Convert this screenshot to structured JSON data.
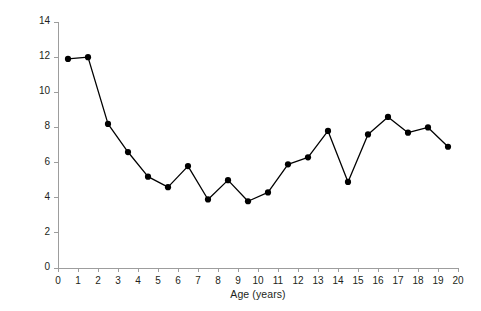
{
  "chart_data": {
    "type": "line",
    "title": "",
    "subtitle": "",
    "xlabel": "Age (years)",
    "ylabel": "AML incidence per million",
    "xlim": [
      0,
      20
    ],
    "ylim": [
      0,
      14
    ],
    "xticks": [
      0,
      1,
      2,
      3,
      4,
      5,
      6,
      7,
      8,
      9,
      10,
      11,
      12,
      13,
      14,
      15,
      16,
      17,
      18,
      19,
      20
    ],
    "yticks": [
      0,
      2,
      4,
      6,
      8,
      10,
      12,
      14
    ],
    "grid": false,
    "legend": null,
    "marker": "filled-circle",
    "line_color": "#000000",
    "marker_color": "#000000",
    "axis_color": "#9d9d9d",
    "background_color": "#ffffff",
    "note": "Data points plotted at mid-bin age positions (0.5, 1.5, ... 19.5).",
    "x": [
      0.5,
      1.5,
      2.5,
      3.5,
      4.5,
      5.5,
      6.5,
      7.5,
      8.5,
      9.5,
      10.5,
      11.5,
      12.5,
      13.5,
      14.5,
      15.5,
      16.5,
      17.5,
      18.5,
      19.5
    ],
    "values": [
      11.9,
      12.0,
      8.2,
      6.6,
      5.2,
      4.6,
      5.8,
      3.9,
      5.0,
      3.8,
      4.3,
      5.9,
      6.3,
      7.8,
      4.9,
      7.6,
      8.6,
      7.7,
      8.0,
      6.9
    ],
    "series": [
      {
        "name": "AML incidence",
        "values": [
          11.9,
          12.0,
          8.2,
          6.6,
          5.2,
          4.6,
          5.8,
          3.9,
          5.0,
          3.8,
          4.3,
          5.9,
          6.3,
          7.8,
          4.9,
          7.6,
          8.6,
          7.7,
          8.0,
          6.9
        ]
      }
    ]
  }
}
